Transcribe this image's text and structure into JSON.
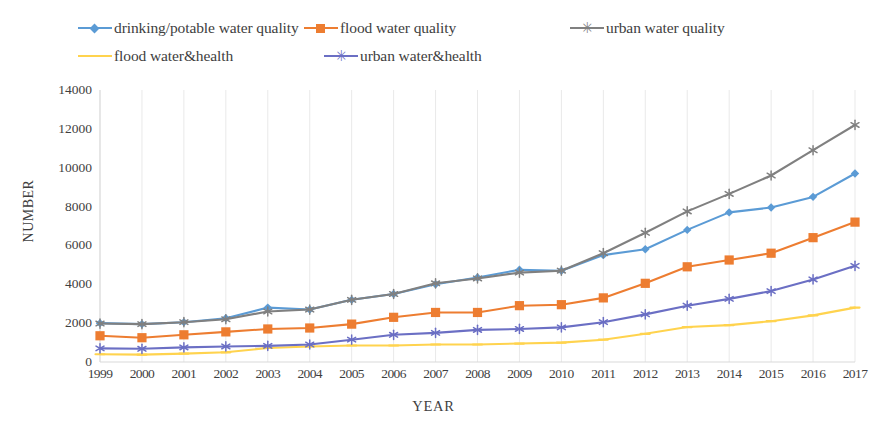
{
  "chart_data": {
    "type": "line",
    "title": "",
    "xlabel": "YEAR",
    "ylabel": "NUMBER",
    "ylim": [
      0,
      14000
    ],
    "ytick_step": 2000,
    "yticks": [
      "14000",
      "12000",
      "10000",
      "8000",
      "6000",
      "4000",
      "2000",
      "0"
    ],
    "grid": "vertical-only",
    "legend_position": "top",
    "categories": [
      "1999",
      "2000",
      "2001",
      "2002",
      "2003",
      "2004",
      "2005",
      "2006",
      "2007",
      "2008",
      "2009",
      "2010",
      "2011",
      "2012",
      "2013",
      "2014",
      "2015",
      "2016",
      "2017"
    ],
    "series": [
      {
        "name": "drinking/potable water quality",
        "color": "#5B9BD5",
        "marker": "diamond",
        "values": [
          2000,
          1950,
          2050,
          2250,
          2800,
          2700,
          3200,
          3500,
          4000,
          4350,
          4750,
          4700,
          5500,
          5800,
          6800,
          7700,
          7950,
          8500,
          9700
        ]
      },
      {
        "name": "flood water quality",
        "color": "#ED7D31",
        "marker": "square",
        "values": [
          1350,
          1250,
          1400,
          1550,
          1700,
          1750,
          1950,
          2300,
          2550,
          2550,
          2900,
          2950,
          3300,
          4050,
          4900,
          5250,
          5600,
          6400,
          7200
        ]
      },
      {
        "name": "urban water quality",
        "color": "#808080",
        "marker": "star",
        "values": [
          1980,
          1950,
          2050,
          2200,
          2600,
          2700,
          3200,
          3500,
          4050,
          4300,
          4600,
          4700,
          5600,
          6650,
          7750,
          8650,
          9600,
          10900,
          12200
        ]
      },
      {
        "name": "flood water&health",
        "color": "#FFD34E",
        "marker": "line",
        "values": [
          400,
          380,
          430,
          500,
          720,
          800,
          850,
          850,
          900,
          900,
          950,
          1000,
          1150,
          1450,
          1800,
          1900,
          2100,
          2400,
          2800
        ]
      },
      {
        "name": "urban water&health",
        "color": "#6B6FC4",
        "marker": "star",
        "values": [
          700,
          680,
          750,
          800,
          830,
          900,
          1150,
          1400,
          1500,
          1650,
          1700,
          1780,
          2050,
          2450,
          2900,
          3250,
          3650,
          4250,
          4950
        ]
      }
    ]
  },
  "legend": {
    "rows": [
      [
        {
          "label": "drinking/potable water quality",
          "color": "#5B9BD5",
          "marker": "diamond",
          "offset": 0
        },
        {
          "label": "flood water quality",
          "color": "#ED7D31",
          "marker": "square",
          "offset": 226
        },
        {
          "label": "urban water quality",
          "color": "#808080",
          "marker": "star",
          "offset": 492
        }
      ],
      [
        {
          "label": "flood water&health",
          "color": "#FFD34E",
          "marker": "line",
          "offset": 0
        },
        {
          "label": "urban water&health",
          "color": "#6B6FC4",
          "marker": "star",
          "offset": 246
        }
      ]
    ]
  },
  "axes": {
    "ylabel": "NUMBER",
    "xlabel": "YEAR"
  }
}
